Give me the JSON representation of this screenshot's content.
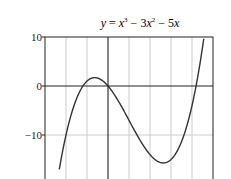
{
  "chart_data": {
    "type": "line",
    "title_parts": {
      "lhs": "y",
      "eq": " = ",
      "t1": "x",
      "e1": "3",
      "op1": " − 3",
      "t2": "x",
      "e2": "2",
      "op2": " − 5",
      "t3": "x"
    },
    "xlabel": "",
    "ylabel": "",
    "xlim": [
      -3,
      5
    ],
    "ylim": [
      -20,
      10
    ],
    "grid": true,
    "x_ticks": [
      -3,
      -2,
      -1,
      0,
      1,
      2,
      3,
      4,
      5
    ],
    "x_tick_labels": [
      "−3",
      "−2",
      "−1",
      "0",
      "1",
      "2",
      "3",
      "4",
      "5"
    ],
    "y_ticks": [
      10,
      0,
      -10,
      -20
    ],
    "y_tick_labels": [
      "10",
      "0",
      "−10",
      "−20"
    ],
    "series": [
      {
        "name": "y = x^3 - 3x^2 - 5x",
        "function": "x^3 - 3x^2 - 5x",
        "x": [
          -2.32,
          -2,
          -1.5,
          -1,
          -0.67,
          -0.5,
          0,
          0.5,
          1,
          1.5,
          2,
          2.5,
          2.67,
          3,
          3.5,
          4,
          4.5,
          4.83
        ],
        "values": [
          -20,
          -10,
          -0.375,
          1,
          1.48,
          1.38,
          0,
          -3.13,
          -7,
          -11.0,
          -14,
          -15.6,
          -15.7,
          -15,
          -11.4,
          -4,
          7.9,
          10
        ]
      }
    ],
    "colors": {
      "line": "#333333",
      "grid": "#cccccc",
      "axis": "#222222"
    }
  }
}
